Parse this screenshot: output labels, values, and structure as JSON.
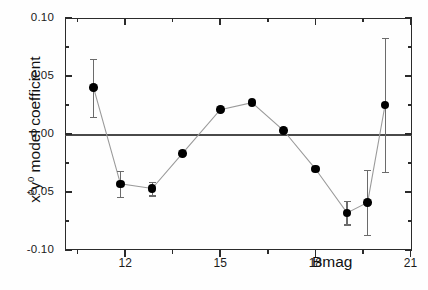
{
  "figure": {
    "background": "#ffffff",
    "frame_color": "#2b2b2b",
    "marker_color": "#000000",
    "line_color": "#9a9a9a",
    "errorbar_color": "#6b6b6b",
    "zeroline_color": "#4a4a4a"
  },
  "axes": {
    "y_title_prefix": "x",
    "y_title_sup1": "0",
    "y_title_mid": "y",
    "y_title_sup2": "0",
    "y_title_suffix": " model coefficient",
    "y_title_plain": "x0y0 model coefficient",
    "x_title": "Bmag",
    "y_ticks": [
      "0.10",
      "0.05",
      "0.00",
      "-0.05",
      "-0.10"
    ],
    "x_ticks": [
      "12",
      "15",
      "18",
      "21"
    ]
  },
  "chart_data": {
    "type": "line",
    "title": "",
    "xlabel": "Bmag",
    "ylabel": "x^0 y^0 model coefficient",
    "xlim": [
      10.1,
      21.05
    ],
    "ylim": [
      -0.1,
      0.1
    ],
    "grid": false,
    "legend": null,
    "y_tick_values": [
      0.1,
      0.05,
      0.0,
      -0.05,
      -0.1
    ],
    "y_minor_tick_values": [
      0.075,
      0.025,
      -0.025,
      -0.075
    ],
    "x_tick_values": [
      12,
      15,
      18,
      21
    ],
    "x_minor_tick_values": [
      10.5,
      13.5,
      16.5,
      19.5
    ],
    "zero_reference_line": 0.0,
    "series": [
      {
        "name": "x0y0 model coefficient",
        "x": [
          11.0,
          11.85,
          12.85,
          13.8,
          15.0,
          16.0,
          17.0,
          18.0,
          19.0,
          19.65,
          20.2
        ],
        "values": [
          0.04,
          -0.043,
          -0.047,
          -0.017,
          0.021,
          0.027,
          0.003,
          -0.03,
          -0.068,
          -0.059,
          0.025
        ],
        "yerr": [
          0.025,
          0.011,
          0.006,
          0.0,
          0.0,
          0.0,
          0.0,
          0.0,
          0.01,
          0.028,
          0.058
        ]
      }
    ]
  }
}
